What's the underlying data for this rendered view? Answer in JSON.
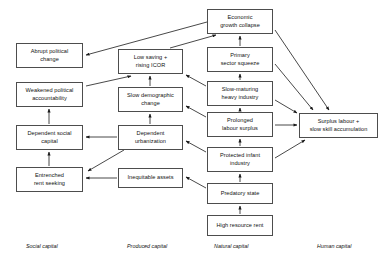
{
  "figure": {
    "type": "flow-diagram",
    "background_color": "#ffffff",
    "box_border_color": "#4d4d4d",
    "arrow_color": "#1a1a1a",
    "width": 382,
    "height": 264
  },
  "nodes": [
    {
      "id": "economic-growth-collapse",
      "label": "Economic\ngrowth collapse",
      "column": "natural",
      "x": 207,
      "y": 9,
      "w": 66,
      "h": 25
    },
    {
      "id": "abrupt-political-change",
      "label": "Abrupt political\nchange",
      "column": "social",
      "x": 16,
      "y": 43,
      "w": 67,
      "h": 25
    },
    {
      "id": "low-saving-rising-icor",
      "label": "Low saving +\nrising ICOR",
      "column": "produced",
      "x": 118,
      "y": 49,
      "w": 65,
      "h": 25
    },
    {
      "id": "primary-sector-squeeze",
      "label": "Primary\nsector squeeze",
      "column": "natural",
      "x": 207,
      "y": 47,
      "w": 66,
      "h": 25
    },
    {
      "id": "weakened-political-accountability",
      "label": "Weakened political\naccountability",
      "column": "social",
      "x": 16,
      "y": 82,
      "w": 67,
      "h": 25
    },
    {
      "id": "slow-demographic-change",
      "label": "Slow demographic\nchange",
      "column": "produced",
      "x": 118,
      "y": 87,
      "w": 65,
      "h": 25
    },
    {
      "id": "slow-maturing-heavy-industry",
      "label": "Slow-maturing\nheavy industry",
      "column": "natural",
      "x": 207,
      "y": 81,
      "w": 66,
      "h": 25
    },
    {
      "id": "prolonged-labour-surplus",
      "label": "Prolonged\nlabour surplus",
      "column": "natural",
      "x": 207,
      "y": 112,
      "w": 66,
      "h": 25
    },
    {
      "id": "surplus-labour-slow-skill-accumulation",
      "label": "Surplus labour +\nslow skill accumulation",
      "column": "human",
      "x": 299,
      "y": 113,
      "w": 79,
      "h": 25
    },
    {
      "id": "dependent-social-capital",
      "label": "Dependent social\ncapital",
      "column": "social",
      "x": 16,
      "y": 125,
      "w": 67,
      "h": 25
    },
    {
      "id": "dependent-urbanization",
      "label": "Dependent\nurbanization",
      "column": "produced",
      "x": 118,
      "y": 125,
      "w": 65,
      "h": 25
    },
    {
      "id": "protected-infant-industry",
      "label": "Protected infant\nindustry",
      "column": "natural",
      "x": 207,
      "y": 147,
      "w": 66,
      "h": 25
    },
    {
      "id": "entrenched-rent-seeking",
      "label": "Entrenched\nrent seeking",
      "column": "social",
      "x": 16,
      "y": 167,
      "w": 67,
      "h": 25
    },
    {
      "id": "inequitable-assets",
      "label": "Inequitable assets",
      "column": "produced",
      "x": 118,
      "y": 168,
      "w": 65,
      "h": 20
    },
    {
      "id": "predatory-state",
      "label": "Predatory state",
      "column": "natural",
      "x": 207,
      "y": 183,
      "w": 66,
      "h": 21
    },
    {
      "id": "high-resource-rent",
      "label": "High resource rent",
      "column": "natural",
      "x": 207,
      "y": 215,
      "w": 66,
      "h": 21
    }
  ],
  "column_labels": [
    {
      "id": "social-capital",
      "label": "Social capital",
      "x": 26,
      "y": 243
    },
    {
      "id": "produced-capital",
      "label": "Produced capital",
      "x": 127,
      "y": 243
    },
    {
      "id": "natural-capital",
      "label": "Natural capital",
      "x": 214,
      "y": 243
    },
    {
      "id": "human-capital",
      "label": "Human capital",
      "x": 317,
      "y": 243
    }
  ],
  "edges": [
    {
      "from": "economic-growth-collapse",
      "to": "abrupt-political-change",
      "x1": 207,
      "y1": 22,
      "x2": 86,
      "y2": 55
    },
    {
      "from": "low-saving-rising-icor",
      "to": "economic-growth-collapse",
      "x1": 170,
      "y1": 48,
      "x2": 216,
      "y2": 35
    },
    {
      "from": "weakened-political-accountability",
      "to": "low-saving-rising-icor",
      "x1": 86,
      "y1": 86,
      "x2": 131,
      "y2": 76
    },
    {
      "from": "slow-demographic-change",
      "to": "low-saving-rising-icor",
      "x1": 150,
      "y1": 86,
      "x2": 150,
      "y2": 76
    },
    {
      "from": "dependent-social-capital",
      "to": "weakened-political-accountability",
      "x1": 49,
      "y1": 124,
      "x2": 49,
      "y2": 109
    },
    {
      "from": "dependent-urbanization",
      "to": "slow-demographic-change",
      "x1": 150,
      "y1": 124,
      "x2": 150,
      "y2": 114
    },
    {
      "from": "entrenched-rent-seeking",
      "to": "dependent-social-capital",
      "x1": 49,
      "y1": 166,
      "x2": 49,
      "y2": 152
    },
    {
      "from": "dependent-urbanization",
      "to": "dependent-social-capital",
      "x1": 117,
      "y1": 137,
      "x2": 86,
      "y2": 137
    },
    {
      "from": "dependent-urbanization",
      "to": "entrenched-rent-seeking",
      "x1": 124,
      "y1": 150,
      "x2": 88,
      "y2": 171
    },
    {
      "from": "inequitable-assets",
      "to": "entrenched-rent-seeking",
      "x1": 117,
      "y1": 178,
      "x2": 86,
      "y2": 178
    },
    {
      "from": "primary-sector-squeeze",
      "to": "economic-growth-collapse",
      "x1": 240,
      "y1": 46,
      "x2": 240,
      "y2": 36
    },
    {
      "from": "slow-maturing-heavy-industry",
      "to": "primary-sector-squeeze",
      "x1": 240,
      "y1": 80,
      "x2": 240,
      "y2": 74
    },
    {
      "from": "prolonged-labour-surplus",
      "to": "slow-maturing-heavy-industry",
      "x1": 240,
      "y1": 111,
      "x2": 240,
      "y2": 108
    },
    {
      "from": "protected-infant-industry",
      "to": "prolonged-labour-surplus",
      "x1": 240,
      "y1": 146,
      "x2": 240,
      "y2": 139
    },
    {
      "from": "predatory-state",
      "to": "protected-infant-industry",
      "x1": 240,
      "y1": 182,
      "x2": 240,
      "y2": 174
    },
    {
      "from": "high-resource-rent",
      "to": "predatory-state",
      "x1": 240,
      "y1": 214,
      "x2": 240,
      "y2": 206
    },
    {
      "from": "prolonged-labour-surplus",
      "to": "surplus-labour-slow-skill-accumulation",
      "x1": 275,
      "y1": 125,
      "x2": 297,
      "y2": 125
    },
    {
      "from": "economic-growth-collapse",
      "to": "surplus-labour-slow-skill-accumulation",
      "x1": 275,
      "y1": 30,
      "x2": 329,
      "y2": 110
    },
    {
      "from": "primary-sector-squeeze",
      "to": "surplus-labour-slow-skill-accumulation",
      "x1": 275,
      "y1": 64,
      "x2": 313,
      "y2": 110
    },
    {
      "from": "slow-maturing-heavy-industry",
      "to": "surplus-labour-slow-skill-accumulation",
      "x1": 275,
      "y1": 100,
      "x2": 297,
      "y2": 113
    },
    {
      "from": "protected-infant-industry",
      "to": "surplus-labour-slow-skill-accumulation",
      "x1": 275,
      "y1": 158,
      "x2": 305,
      "y2": 140
    },
    {
      "from": "slow-maturing-heavy-industry",
      "to": "low-saving-rising-icor",
      "x1": 206,
      "y1": 86,
      "x2": 186,
      "y2": 75
    },
    {
      "from": "prolonged-labour-surplus",
      "to": "slow-demographic-change",
      "x1": 206,
      "y1": 117,
      "x2": 186,
      "y2": 106
    },
    {
      "from": "protected-infant-industry",
      "to": "dependent-urbanization",
      "x1": 206,
      "y1": 152,
      "x2": 186,
      "y2": 141
    },
    {
      "from": "predatory-state",
      "to": "inequitable-assets",
      "x1": 206,
      "y1": 188,
      "x2": 186,
      "y2": 177
    }
  ]
}
